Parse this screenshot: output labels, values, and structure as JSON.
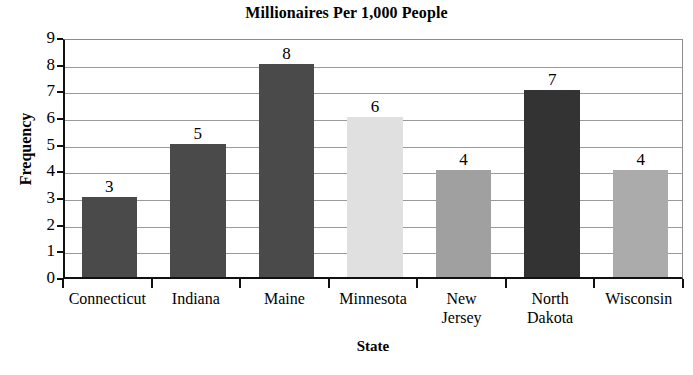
{
  "chart_data": {
    "type": "bar",
    "title": "Millionaires Per 1,000 People",
    "xlabel": "State",
    "ylabel": "Frequency",
    "categories": [
      "Connecticut",
      "Indiana",
      "Maine",
      "Minnesota",
      "New Jersey",
      "North Dakota",
      "Wisconsin"
    ],
    "category_lines": [
      [
        "Connecticut"
      ],
      [
        "Indiana"
      ],
      [
        "Maine"
      ],
      [
        "Minnesota"
      ],
      [
        "New",
        "Jersey"
      ],
      [
        "North",
        "Dakota"
      ],
      [
        "Wisconsin"
      ]
    ],
    "values": [
      3,
      5,
      8,
      6,
      4,
      7,
      4
    ],
    "value_labels": [
      "3",
      "5",
      "8",
      "6",
      "4",
      "7",
      "4"
    ],
    "bar_colors": [
      "#4a4a4a",
      "#4a4a4a",
      "#4a4a4a",
      "#e0e0e0",
      "#a0a0a0",
      "#333333",
      "#ababab"
    ],
    "ylim": [
      0,
      9
    ],
    "y_ticks": [
      0,
      1,
      2,
      3,
      4,
      5,
      6,
      7,
      8,
      9
    ],
    "y_tick_labels": [
      "0",
      "1",
      "2",
      "3",
      "4",
      "5",
      "6",
      "7",
      "8",
      "9"
    ],
    "grid": true,
    "legend": false,
    "axis_color": "#111111",
    "grid_color": "#9a9a9a",
    "background": "#ffffff"
  }
}
